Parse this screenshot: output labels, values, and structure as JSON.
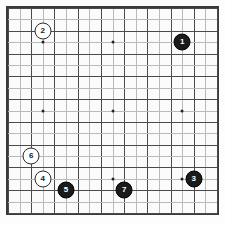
{
  "board": {
    "kind": "go-board",
    "size": 19,
    "line_color": "#4a4a4a",
    "border_color": "#3a3a3a",
    "background_color": "#fbfbfb",
    "black_stone_color": "#1b1b1b",
    "white_stone_color": "#ffffff",
    "star_points": [
      {
        "col": 4,
        "row": 4
      },
      {
        "col": 10,
        "row": 4
      },
      {
        "col": 16,
        "row": 4
      },
      {
        "col": 4,
        "row": 10
      },
      {
        "col": 10,
        "row": 10
      },
      {
        "col": 16,
        "row": 10
      },
      {
        "col": 4,
        "row": 16
      },
      {
        "col": 10,
        "row": 16
      },
      {
        "col": 16,
        "row": 16
      }
    ],
    "stones": [
      {
        "label": "1",
        "color": "black",
        "col": 16,
        "row": 4
      },
      {
        "label": "2",
        "color": "white",
        "col": 4,
        "row": 3
      },
      {
        "label": "3",
        "color": "black",
        "col": 17,
        "row": 16
      },
      {
        "label": "4",
        "color": "white",
        "col": 4,
        "row": 16
      },
      {
        "label": "5",
        "color": "black",
        "col": 6,
        "row": 17
      },
      {
        "label": "6",
        "color": "white",
        "col": 3,
        "row": 14
      },
      {
        "label": "7",
        "color": "black",
        "col": 11,
        "row": 17
      }
    ]
  }
}
